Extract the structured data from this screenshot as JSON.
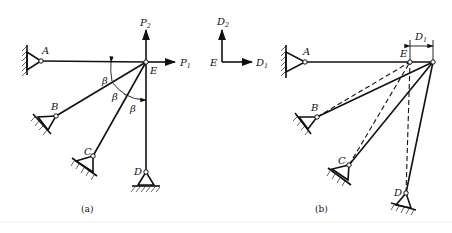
{
  "figure": {
    "panel_a": {
      "caption": "(a)",
      "joint": "E",
      "supports": [
        "A",
        "B",
        "C",
        "D"
      ],
      "loads": [
        {
          "name": "P",
          "sub": "1",
          "direction": "right"
        },
        {
          "name": "P",
          "sub": "2",
          "direction": "up"
        }
      ],
      "angle_label": "β",
      "angle_count": 3
    },
    "axes": {
      "origin": "E",
      "x": {
        "name": "D",
        "sub": "1"
      },
      "y": {
        "name": "D",
        "sub": "2"
      }
    },
    "panel_b": {
      "caption": "(b)",
      "joint": "E",
      "supports": [
        "A",
        "B",
        "C",
        "D"
      ],
      "dimension": {
        "name": "D",
        "sub": "1"
      }
    }
  }
}
